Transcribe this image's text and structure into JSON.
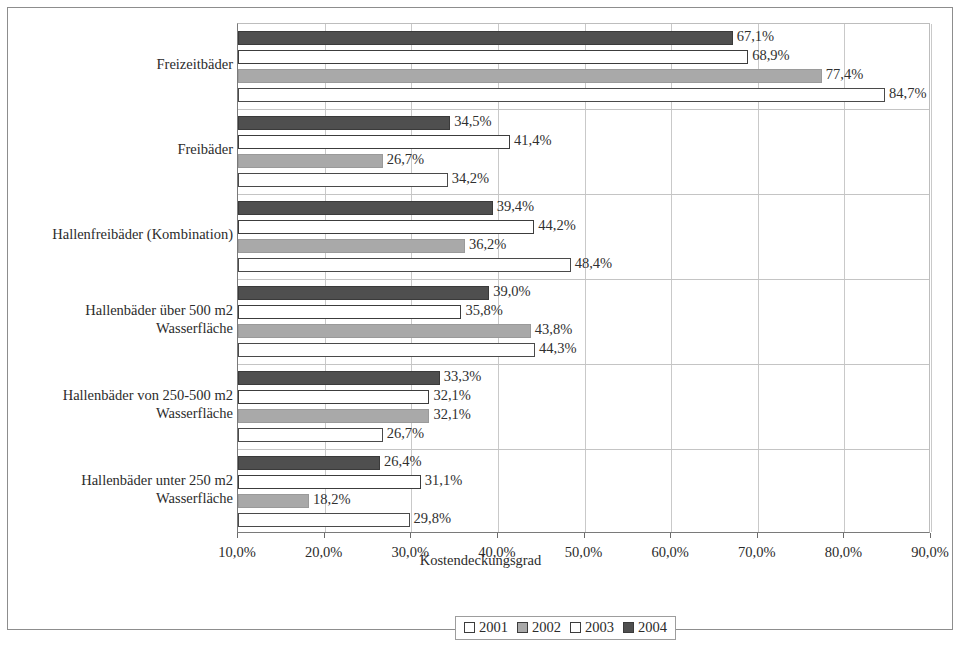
{
  "chart_data": {
    "type": "bar",
    "orientation": "horizontal",
    "title": "",
    "xlabel": "Kostendeckungsgrad",
    "ylabel": "",
    "xlim": [
      10.0,
      90.0
    ],
    "xticks": [
      "10,0%",
      "20,0%",
      "30,0%",
      "40,0%",
      "50,0%",
      "60,0%",
      "70,0%",
      "80,0%",
      "90,0%"
    ],
    "xtick_values": [
      10,
      20,
      30,
      40,
      50,
      60,
      70,
      80,
      90
    ],
    "grid": true,
    "legend_position": "bottom",
    "value_labels": true,
    "categories": [
      "Freizeitbäder",
      "Freibäder",
      "Hallenfreibäder (Kombination)",
      "Hallenbäder über 500 m2 Wasserfläche",
      "Hallenbäder von 250-500 m2 Wasserfläche",
      "Hallenbäder unter 250 m2 Wasserfläche"
    ],
    "series": [
      {
        "name": "2001",
        "color": "#ffffff",
        "values": [
          84.7,
          34.2,
          48.4,
          44.3,
          26.7,
          29.8
        ],
        "labels": [
          "84,7%",
          "34,2%",
          "48,4%",
          "44,3%",
          "26,7%",
          "29,8%"
        ]
      },
      {
        "name": "2002",
        "color": "#a9a9a9",
        "values": [
          77.4,
          26.7,
          36.2,
          43.8,
          32.1,
          18.2
        ],
        "labels": [
          "77,4%",
          "26,7%",
          "36,2%",
          "43,8%",
          "32,1%",
          "18,2%"
        ]
      },
      {
        "name": "2003",
        "color": "#ffffff",
        "values": [
          68.9,
          41.4,
          44.2,
          35.8,
          32.1,
          31.1
        ],
        "labels": [
          "68,9%",
          "41,4%",
          "44,2%",
          "35,8%",
          "32,1%",
          "31,1%"
        ]
      },
      {
        "name": "2004",
        "color": "#4f4f4f",
        "values": [
          67.1,
          34.5,
          39.4,
          39.0,
          33.3,
          26.4
        ],
        "labels": [
          "67,1%",
          "34,5%",
          "39,4%",
          "39,0%",
          "33,3%",
          "26,4%"
        ]
      }
    ]
  },
  "legend": {
    "items": [
      {
        "label": "2001",
        "series": "s2001"
      },
      {
        "label": "2002",
        "series": "s2002"
      },
      {
        "label": "2003",
        "series": "s2003"
      },
      {
        "label": "2004",
        "series": "s2004"
      }
    ]
  },
  "category_lines": [
    [
      "Freizeitbäder"
    ],
    [
      "Freibäder"
    ],
    [
      "Hallenfreibäder (Kombination)"
    ],
    [
      "Hallenbäder über 500 m2",
      "Wasserfläche"
    ],
    [
      "Hallenbäder von 250-500 m2",
      "Wasserfläche"
    ],
    [
      "Hallenbäder unter 250 m2",
      "Wasserfläche"
    ]
  ]
}
